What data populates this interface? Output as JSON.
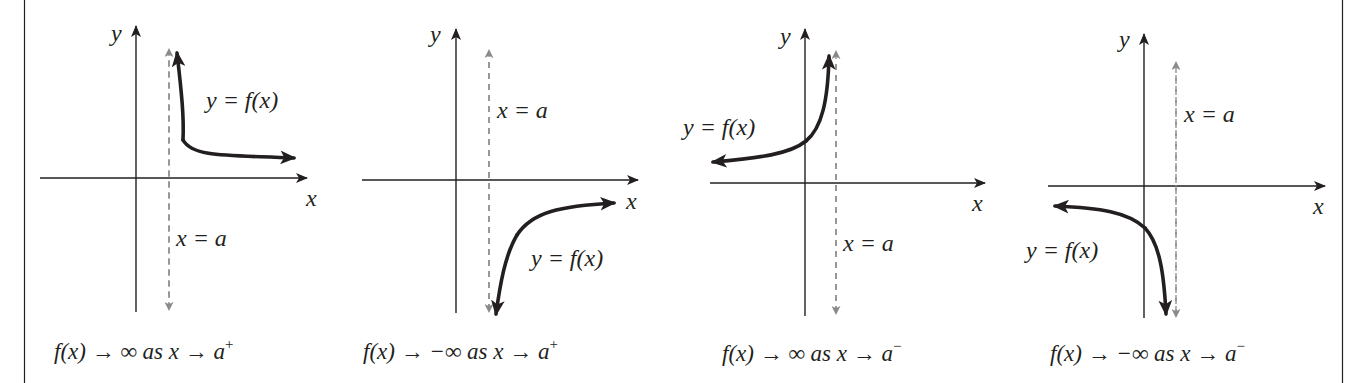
{
  "figure": {
    "colors": {
      "ink": "#231f20",
      "asymptote": "#8a8a8a",
      "background": "#ffffff"
    },
    "panels": [
      {
        "id": "p1",
        "axis_x_label": "x",
        "axis_y_label": "y",
        "curve_label": "y = f(x)",
        "asymptote_label": "x = a",
        "caption": {
          "lhs": "f(x) → ∞ as x → a",
          "sup": "+"
        },
        "behavior": "f(x) → ∞ as x → a⁺"
      },
      {
        "id": "p2",
        "axis_x_label": "x",
        "axis_y_label": "y",
        "curve_label": "y = f(x)",
        "asymptote_label": "x = a",
        "caption": {
          "lhs": "f(x) → −∞ as x → a",
          "sup": "+"
        },
        "behavior": "f(x) → −∞ as x → a⁺"
      },
      {
        "id": "p3",
        "axis_x_label": "x",
        "axis_y_label": "y",
        "curve_label": "y = f(x)",
        "asymptote_label": "x = a",
        "caption": {
          "lhs": "f(x) → ∞ as x → a",
          "sup": "−"
        },
        "behavior": "f(x) → ∞ as x → a⁻"
      },
      {
        "id": "p4",
        "axis_x_label": "x",
        "axis_y_label": "y",
        "curve_label": "y = f(x)",
        "asymptote_label": "x = a",
        "caption": {
          "lhs": "f(x) → −∞ as x → a",
          "sup": "−"
        },
        "behavior": "f(x) → −∞ as x → a⁻"
      }
    ]
  }
}
